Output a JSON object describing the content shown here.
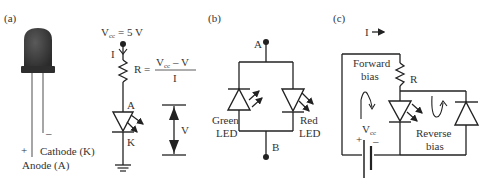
{
  "panels": {
    "a": {
      "label": "(a)",
      "led_photo": {
        "plus": "+",
        "minus": "–",
        "cathode_label": "Cathode (K)",
        "anode_label": "Anode (A)"
      },
      "circuit": {
        "vcc_main": "V",
        "vcc_sub": "cc",
        "vcc_value": " = 5 V",
        "current_label": "I",
        "formula_r": "R =",
        "formula_num_main": "V",
        "formula_num_sub": "cc",
        "formula_num_rest": " – V",
        "formula_den": "I",
        "anode": "A",
        "cathode": "K",
        "voltage_label": "V"
      }
    },
    "b": {
      "label": "(b)",
      "node_a": "A",
      "node_b": "B",
      "green_led_line1": "Green",
      "green_led_line2": "LED",
      "red_led_line1": "Red",
      "red_led_line2": "LED"
    },
    "c": {
      "label": "(c)",
      "current_label": "I",
      "forward_line1": "Forward",
      "forward_line2": "bias",
      "resistor_label": "R",
      "vcc_main": "V",
      "vcc_sub": "cc",
      "plus": "+",
      "minus": "–",
      "reverse_line1": "Reverse",
      "reverse_line2": "bias"
    }
  },
  "colors": {
    "line": "#222222",
    "led_body": "#3a3a3a",
    "text": "#333333",
    "background": "#ffffff"
  }
}
